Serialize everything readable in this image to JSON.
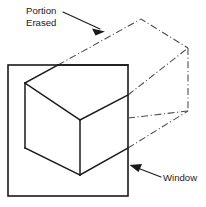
{
  "figure": {
    "type": "technical-line-drawing",
    "background_color": "#ffffff",
    "labels": {
      "portion_erased_line1": "Portion",
      "portion_erased_line2": "Erased",
      "window": "Window"
    },
    "colors": {
      "solid_stroke": "#1a1a1a",
      "phantom_stroke": "#4a4a52",
      "leader_stroke": "#1a1a1a",
      "text": "#1a1a1a"
    },
    "geometry": {
      "window_rect": {
        "x": 8,
        "y": 65,
        "width": 120,
        "height": 131
      },
      "box_solid_path": "M25,83 L58,65 L128,95 M25,83 L25,148 M58,65 L128,65 M80,120 L25,83 M80,120 L128,95 M80,120 L80,175 M25,148 L80,175 M80,175 L128,148",
      "phantom_top_edge": "M58,65 L141,19 L188,48",
      "phantom_right_vertical": "M188,48 L188,111",
      "phantom_upper_diagonal": "M128,95 L188,48",
      "phantom_lower_diagonal": "M128,118 L188,111",
      "phantom_bottom_edge": "M128,148 L188,111",
      "leader_portion_erased": "M62,13 L101,30",
      "arrow_portion_erased": {
        "tip_x": 104,
        "tip_y": 31,
        "angle_deg": 24
      },
      "leader_window": "M160,177 L134,167",
      "arrow_window": {
        "tip_x": 130,
        "tip_y": 166,
        "angle_deg": 201
      }
    },
    "text_positions": {
      "portion_x": 26,
      "portion_y": 13,
      "erased_x": 26,
      "erased_y": 25,
      "window_x": 163,
      "window_y": 181
    }
  }
}
